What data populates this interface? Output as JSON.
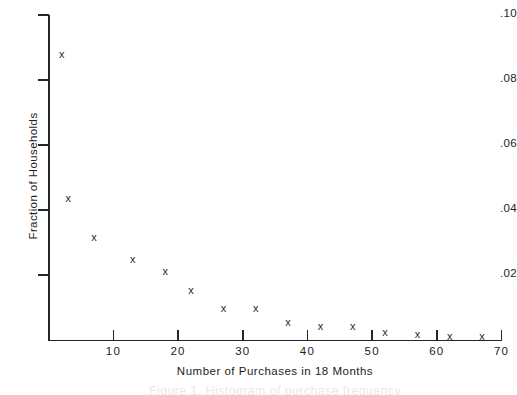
{
  "chart_data": {
    "type": "scatter",
    "title": "",
    "xlabel": "Number of Purchases in 18 Months",
    "ylabel": "Fraction of Households",
    "xlim": [
      0,
      70
    ],
    "ylim": [
      0,
      0.1
    ],
    "grid": false,
    "legend": null,
    "marker": "x",
    "xticks": [
      10,
      20,
      30,
      40,
      50,
      60,
      70
    ],
    "xtick_labels": [
      "10",
      "20",
      "30",
      "40",
      "50",
      "60",
      "70"
    ],
    "yticks": [
      0.02,
      0.04,
      0.06,
      0.08,
      0.1
    ],
    "ytick_labels": [
      ".02",
      ".04",
      ".06",
      ".08",
      ".10"
    ],
    "x": [
      2,
      3,
      7,
      13,
      18,
      22,
      27,
      32,
      37,
      42,
      47,
      52,
      57,
      62,
      67
    ],
    "y": [
      0.088,
      0.0435,
      0.0317,
      0.0247,
      0.0212,
      0.0152,
      0.0098,
      0.0098,
      0.0055,
      0.0043,
      0.0043,
      0.0025,
      0.0018,
      0.0012,
      0.001
    ],
    "points": [
      {
        "x": 2,
        "y": 0.088,
        "label": "x"
      },
      {
        "x": 3,
        "y": 0.0435,
        "label": "x"
      },
      {
        "x": 7,
        "y": 0.0317,
        "label": "x"
      },
      {
        "x": 13,
        "y": 0.0247,
        "label": "x"
      },
      {
        "x": 18,
        "y": 0.0212,
        "label": "x"
      },
      {
        "x": 22,
        "y": 0.0152,
        "label": "x"
      },
      {
        "x": 27,
        "y": 0.0098,
        "label": "x"
      },
      {
        "x": 32,
        "y": 0.0098,
        "label": "x"
      },
      {
        "x": 37,
        "y": 0.0055,
        "label": "x"
      },
      {
        "x": 42,
        "y": 0.0043,
        "label": "x"
      },
      {
        "x": 47,
        "y": 0.0043,
        "label": "x"
      },
      {
        "x": 52,
        "y": 0.0025,
        "label": "x"
      },
      {
        "x": 57,
        "y": 0.0018,
        "label": "x"
      },
      {
        "x": 62,
        "y": 0.0012,
        "label": "x"
      },
      {
        "x": 67,
        "y": 0.001,
        "label": "x"
      }
    ],
    "colors": {
      "axis": "#262626",
      "marker": "#2a2a2a",
      "text": "#1d1d1d",
      "background": "#ffffff"
    }
  },
  "caption": "Figure 1. Histogram of purchase frequency"
}
